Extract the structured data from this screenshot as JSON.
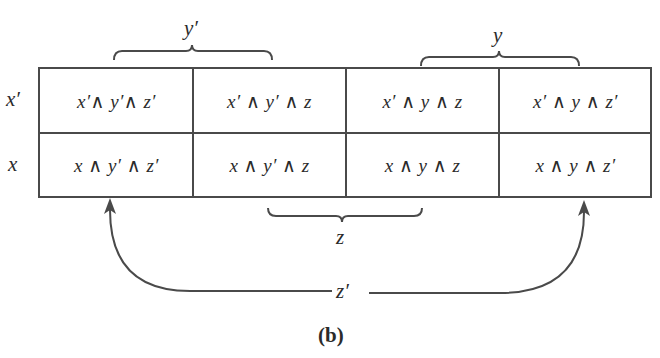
{
  "figure": {
    "caption": "(b)",
    "type": "Karnaugh map (3 variables)"
  },
  "column_groups": {
    "y_prime": {
      "label": "y′",
      "spans_columns": [
        0,
        1
      ]
    },
    "y": {
      "label": "y",
      "spans_columns": [
        2,
        3
      ]
    },
    "z": {
      "label": "z",
      "spans_columns": [
        1,
        2
      ]
    },
    "z_prime": {
      "label": "z′",
      "spans_columns": [
        0,
        3
      ],
      "style": "wrap-around arrows"
    }
  },
  "rows": [
    {
      "label": "x′",
      "cells": [
        "x′∧ y′∧ z′",
        "x′ ∧ y′ ∧ z",
        "x′ ∧ y ∧ z",
        "x′ ∧ y ∧ z′"
      ]
    },
    {
      "label": "x",
      "cells": [
        "x ∧ y′ ∧ z′",
        "x ∧ y′ ∧ z",
        "x ∧ y ∧ z",
        "x ∧ y ∧ z′"
      ]
    }
  ],
  "colors": {
    "line": "#4a4a4a",
    "text": "#2b2b2b",
    "background": "#ffffff"
  }
}
